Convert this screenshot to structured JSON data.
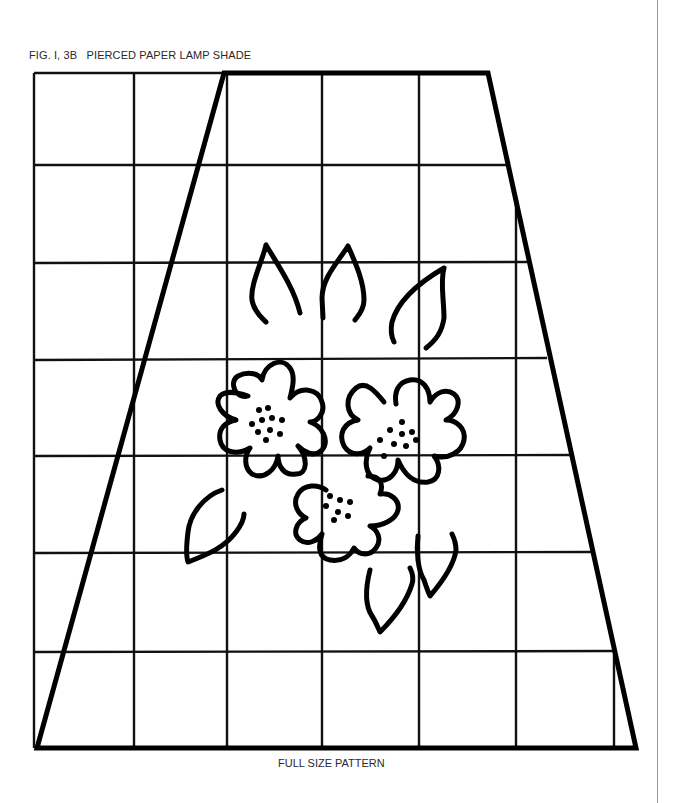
{
  "figure": {
    "title": "FIG. I, 3B   PIERCED PAPER LAMP SHADE",
    "footer": "FULL SIZE PATTERN"
  },
  "grid": {
    "columns": 6,
    "rows": 7,
    "x_lines": [
      34,
      134,
      227,
      322,
      419,
      516,
      614
    ],
    "y_lines": [
      73,
      165,
      263,
      360,
      456,
      553,
      652,
      748
    ],
    "line_color": "#111111"
  },
  "lamp_shade_outline": {
    "shape": "trapezoid",
    "top_left": [
      224,
      73
    ],
    "top_right": [
      488,
      73
    ],
    "bottom_right": [
      636,
      748
    ],
    "bottom_left": [
      37,
      748
    ],
    "stroke_color": "#000000"
  },
  "motif": {
    "description": "floral spray with three flowers and six leaves",
    "flowers": 3,
    "leaves": 6
  }
}
